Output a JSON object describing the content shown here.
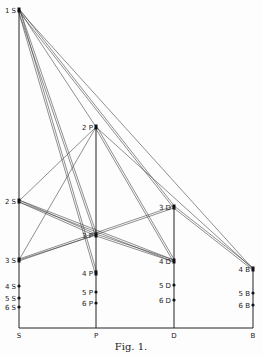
{
  "caption": "Fig. 1.",
  "axes": [
    {
      "id": "S",
      "label": "S",
      "x": 19
    },
    {
      "id": "P",
      "label": "P",
      "x": 96
    },
    {
      "id": "D",
      "label": "D",
      "x": 174
    },
    {
      "id": "B",
      "label": "B",
      "x": 253
    }
  ],
  "baseline_y": 328,
  "levels": [
    {
      "id": "1S",
      "label": "1S",
      "x": 19,
      "y": 10
    },
    {
      "id": "2S",
      "label": "2S",
      "x": 19,
      "y": 201
    },
    {
      "id": "3S",
      "label": "3S",
      "x": 19,
      "y": 260
    },
    {
      "id": "4S",
      "label": "4S",
      "x": 19,
      "y": 286
    },
    {
      "id": "5S",
      "label": "5S",
      "x": 19,
      "y": 298
    },
    {
      "id": "6S",
      "label": "6S",
      "x": 19,
      "y": 307
    },
    {
      "id": "2P",
      "label": "2P",
      "x": 96,
      "y": 127
    },
    {
      "id": "3P",
      "label": "3P",
      "x": 96,
      "y": 235
    },
    {
      "id": "4P",
      "label": "4P",
      "x": 96,
      "y": 273
    },
    {
      "id": "5P",
      "label": "5P",
      "x": 96,
      "y": 292
    },
    {
      "id": "6P",
      "label": "6P",
      "x": 96,
      "y": 303
    },
    {
      "id": "3D",
      "label": "3D",
      "x": 174,
      "y": 207
    },
    {
      "id": "4D",
      "label": "4D",
      "x": 174,
      "y": 261
    },
    {
      "id": "5D",
      "label": "5D",
      "x": 174,
      "y": 285
    },
    {
      "id": "6D",
      "label": "6D",
      "x": 174,
      "y": 300
    },
    {
      "id": "4B",
      "label": "4B",
      "x": 253,
      "y": 269
    },
    {
      "id": "5B",
      "label": "5B",
      "x": 253,
      "y": 293
    },
    {
      "id": "6B",
      "label": "6B",
      "x": 253,
      "y": 305
    }
  ],
  "transitions": [
    {
      "from": "1S",
      "to": "2P",
      "double": false
    },
    {
      "from": "1S",
      "to": "3P",
      "double": true
    },
    {
      "from": "1S",
      "to": "4P",
      "double": true
    },
    {
      "from": "1S",
      "to": "3D",
      "double": true
    },
    {
      "from": "1S",
      "to": "4B",
      "double": false
    },
    {
      "from": "2P",
      "to": "2S",
      "double": false
    },
    {
      "from": "2P",
      "to": "3S",
      "double": false
    },
    {
      "from": "2P",
      "to": "4D",
      "double": true
    },
    {
      "from": "2P",
      "to": "4B",
      "double": false
    },
    {
      "from": "2S",
      "to": "3P",
      "double": true
    },
    {
      "from": "2S",
      "to": "4D",
      "double": true
    },
    {
      "from": "3S",
      "to": "3P",
      "double": false
    },
    {
      "from": "3S",
      "to": "3D",
      "double": true
    },
    {
      "from": "3P",
      "to": "4D",
      "double": true
    },
    {
      "from": "3D",
      "to": "4B",
      "double": true
    }
  ]
}
